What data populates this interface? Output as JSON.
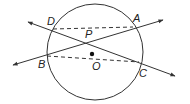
{
  "diagram": {
    "stroke_color": "#333333",
    "circle": {
      "center": [
        95,
        52
      ],
      "radius": 48,
      "label": "O"
    },
    "points": {
      "A": {
        "label": "A",
        "pos": [
          133,
          27
        ]
      },
      "B": {
        "label": "B",
        "pos": [
          47,
          56
        ]
      },
      "C": {
        "label": "C",
        "pos": [
          139,
          62
        ]
      },
      "D": {
        "label": "D",
        "pos": [
          53,
          29
        ]
      },
      "P": {
        "label": "P",
        "pos": [
          87,
          42
        ]
      },
      "O": {
        "label": "O",
        "pos": [
          92,
          54
        ]
      }
    },
    "lines": [
      {
        "name": "line-BA",
        "from": [
          13,
          65
        ],
        "to": [
          163,
          20
        ],
        "style": "solid",
        "arrows": "both"
      },
      {
        "name": "line-DC",
        "from": [
          28,
          22
        ],
        "to": [
          175,
          76
        ],
        "style": "solid",
        "arrows": "both"
      }
    ],
    "chords": [
      {
        "name": "chord-DA",
        "from": "D",
        "to": "A",
        "style": "dashed"
      },
      {
        "name": "chord-BC",
        "from": "B",
        "to": "C",
        "style": "dashed"
      }
    ]
  }
}
